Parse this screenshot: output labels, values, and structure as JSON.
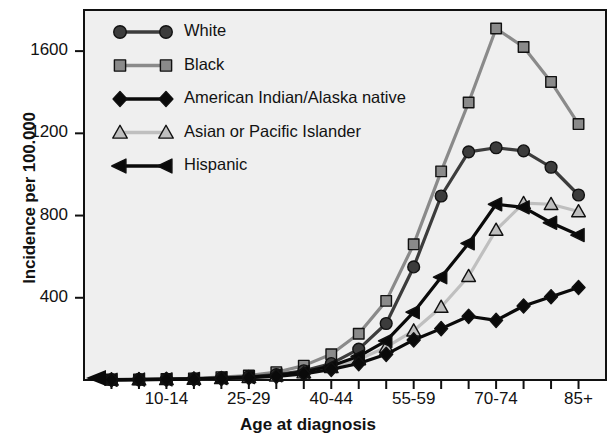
{
  "chart_data": {
    "type": "line",
    "title": "",
    "xlabel": "Age at diagnosis",
    "ylabel": "Incidence per 100.000",
    "ylim": [
      0,
      1800
    ],
    "yticks": [
      400,
      800,
      1200,
      1600
    ],
    "ytick_labels": [
      "400",
      "800",
      "1200",
      "1600"
    ],
    "grid": false,
    "legend_position": "top-left inside plot",
    "categories": [
      "0-4",
      "5-9",
      "10-14",
      "15-19",
      "20-24",
      "25-29",
      "30-34",
      "35-39",
      "40-44",
      "45-49",
      "50-54",
      "55-59",
      "60-64",
      "65-69",
      "70-74",
      "75-79",
      "80-84",
      "85+"
    ],
    "xtick_labels_shown": [
      "10-14",
      "25-29",
      "40-44",
      "55-59",
      "70-74",
      "85+"
    ],
    "xtick_label_indices": [
      2,
      5,
      8,
      11,
      14,
      17
    ],
    "series": [
      {
        "name": "White",
        "marker": "circle",
        "color": "#3c3c3c",
        "values": [
          2,
          3,
          4,
          6,
          10,
          16,
          26,
          45,
          80,
          150,
          275,
          550,
          895,
          1110,
          1130,
          1115,
          1035,
          900
        ]
      },
      {
        "name": "Black",
        "marker": "square",
        "color": "#8a8a8a",
        "values": [
          2,
          3,
          5,
          8,
          14,
          22,
          38,
          70,
          125,
          225,
          385,
          660,
          1015,
          1350,
          1710,
          1620,
          1450,
          1245
        ]
      },
      {
        "name": "American Indian/Alaska native",
        "marker": "diamond",
        "color": "#0a0a0a",
        "values": [
          1,
          2,
          3,
          4,
          7,
          11,
          18,
          30,
          52,
          80,
          125,
          195,
          250,
          310,
          290,
          360,
          405,
          450
        ]
      },
      {
        "name": "Asian or Pacific Islander",
        "marker": "triangle",
        "color": "#bfbfbf",
        "values": [
          1,
          2,
          3,
          5,
          8,
          13,
          21,
          36,
          62,
          100,
          160,
          240,
          355,
          505,
          730,
          860,
          855,
          820
        ]
      },
      {
        "name": "Hispanic",
        "marker": "left-triangle",
        "color": "#0a0a0a",
        "values": [
          1,
          2,
          3,
          5,
          9,
          14,
          23,
          40,
          68,
          115,
          190,
          330,
          500,
          665,
          855,
          840,
          765,
          705
        ]
      }
    ]
  },
  "legend": {
    "items": [
      {
        "label": "White"
      },
      {
        "label": "Black"
      },
      {
        "label": "American Indian/Alaska native"
      },
      {
        "label": "Asian or Pacific Islander"
      },
      {
        "label": "Hispanic"
      }
    ]
  }
}
